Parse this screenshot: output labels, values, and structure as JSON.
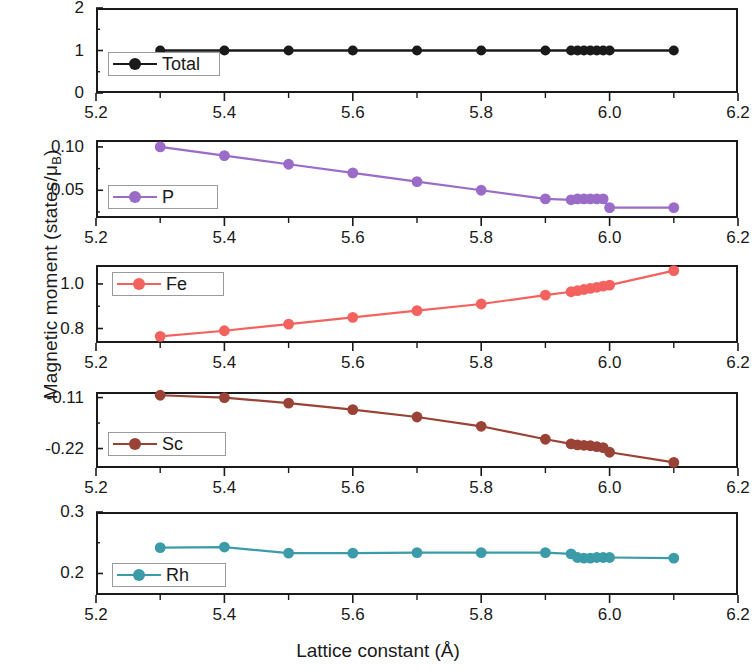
{
  "axis_labels": {
    "y": "Magnetic moment (states/μ",
    "y_sub": "B",
    "y_close": ")",
    "x": "Lattice constant (Å)"
  },
  "xaxis": {
    "min": 5.2,
    "max": 6.2,
    "ticks": [
      5.2,
      5.4,
      5.6,
      5.8,
      6.0,
      6.2
    ],
    "tick_labels": [
      "5.2",
      "5.4",
      "5.6",
      "5.8",
      "6.0",
      "6.2"
    ],
    "minor_per_interval": 1
  },
  "chart_data": {
    "type": "line",
    "title": "",
    "xlabel": "Lattice constant (Å)",
    "ylabel": "Magnetic moment (states/μB)",
    "xlim": [
      5.2,
      6.2
    ],
    "grid": false,
    "legend_position": "inside-left",
    "x": [
      5.3,
      5.4,
      5.5,
      5.6,
      5.7,
      5.8,
      5.9,
      5.94,
      5.95,
      5.96,
      5.97,
      5.98,
      5.99,
      6.0,
      6.1
    ],
    "panels": [
      {
        "name": "Total",
        "color": "#1a1a1a",
        "ylim": [
          0,
          2
        ],
        "yticks": [
          0,
          1,
          2
        ],
        "ytick_labels": [
          "0",
          "1",
          "2"
        ],
        "legend_label": "Total",
        "values": [
          1.0,
          1.0,
          1.0,
          1.0,
          1.0,
          1.0,
          1.0,
          1.0,
          1.0,
          1.0,
          1.0,
          1.0,
          1.0,
          1.0,
          1.0
        ]
      },
      {
        "name": "P",
        "color": "#9b6bc8",
        "ylim": [
          0.018,
          0.108
        ],
        "yticks": [
          0.05,
          0.1
        ],
        "ytick_labels": [
          "0.05",
          "0.10"
        ],
        "legend_label": "P",
        "values": [
          0.1,
          0.09,
          0.08,
          0.07,
          0.06,
          0.05,
          0.04,
          0.039,
          0.04,
          0.04,
          0.04,
          0.04,
          0.04,
          0.03,
          0.03
        ]
      },
      {
        "name": "Fe",
        "color": "#f4625f",
        "ylim": [
          0.735,
          1.085
        ],
        "yticks": [
          0.8,
          1.0
        ],
        "ytick_labels": [
          "0.8",
          "1.0"
        ],
        "legend_label": "Fe",
        "values": [
          0.765,
          0.79,
          0.82,
          0.85,
          0.88,
          0.91,
          0.95,
          0.965,
          0.97,
          0.975,
          0.98,
          0.985,
          0.99,
          0.995,
          1.06
        ]
      },
      {
        "name": "Sc",
        "color": "#9a4235",
        "ylim": [
          -0.262,
          -0.098
        ],
        "yticks": [
          -0.22,
          -0.11
        ],
        "ytick_labels": [
          "-0.22",
          "-0.11"
        ],
        "legend_label": "Sc",
        "values": [
          -0.105,
          -0.11,
          -0.122,
          -0.136,
          -0.152,
          -0.172,
          -0.2,
          -0.21,
          -0.212,
          -0.213,
          -0.214,
          -0.216,
          -0.218,
          -0.228,
          -0.25
        ]
      },
      {
        "name": "Rh",
        "color": "#3b9ba8",
        "ylim": [
          0.165,
          0.3
        ],
        "yticks": [
          0.2,
          0.3
        ],
        "ytick_labels": [
          "0.2",
          "0.3"
        ],
        "legend_label": "Rh",
        "values": [
          0.242,
          0.243,
          0.233,
          0.233,
          0.234,
          0.234,
          0.234,
          0.232,
          0.226,
          0.225,
          0.225,
          0.226,
          0.226,
          0.226,
          0.225
        ]
      }
    ]
  }
}
